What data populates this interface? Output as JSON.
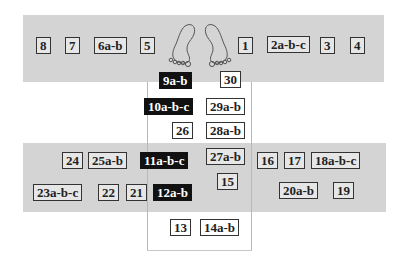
{
  "diagram": {
    "colors": {
      "band": "#d4d4d4",
      "box_fill": "#e6e6e6",
      "box_border": "#333333",
      "highlight_fill": "#111111",
      "highlight_text": "#ffffff"
    },
    "top_band": {
      "left_labels": [
        "8",
        "7",
        "6a-b",
        "5"
      ],
      "right_labels": [
        "1",
        "2a-b-c",
        "3",
        "4"
      ],
      "icon": "feet-icon"
    },
    "column": {
      "rows": [
        {
          "left": "9a-b",
          "left_highlight": true,
          "right": "30",
          "right_highlight": false
        },
        {
          "left": "10a-b-c",
          "left_highlight": true,
          "right": "29a-b",
          "right_highlight": false
        },
        {
          "left": "26",
          "left_highlight": false,
          "right": "28a-b",
          "right_highlight": false
        }
      ]
    },
    "bottom_band": {
      "row1_left": [
        "24",
        "25a-b"
      ],
      "row1_center_highlight": "11a-b-c",
      "row1_right": [
        "27a-b",
        "16",
        "17",
        "18a-b-c"
      ],
      "row2_left": [
        "23a-b-c",
        "22",
        "21"
      ],
      "row2_center_highlight": "12a-b",
      "row2_center_right": "15",
      "row2_right": [
        "20a-b",
        "19"
      ]
    },
    "below": {
      "labels": [
        "13",
        "14a-b"
      ]
    }
  }
}
